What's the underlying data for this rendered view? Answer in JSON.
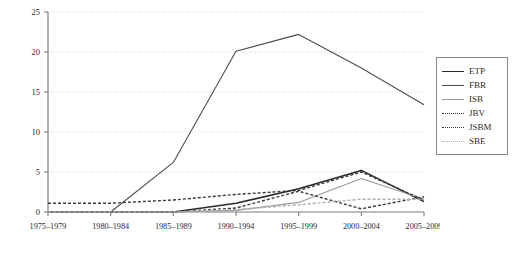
{
  "chart_data": {
    "type": "line",
    "title": "",
    "xlabel": "",
    "ylabel": "",
    "grid": true,
    "legend_position": "right",
    "ylim": [
      0,
      25
    ],
    "yticks": [
      0,
      5,
      10,
      15,
      20,
      25
    ],
    "ytick_labels": [
      "0",
      "5",
      "10",
      "15",
      "20",
      "25"
    ],
    "categories": [
      "1975–1979",
      "1980–1984",
      "1985–1989",
      "1990–1994",
      "1995–1999",
      "2000–2004",
      "2005–2009"
    ],
    "series": [
      {
        "name": "ETP",
        "style": "solid",
        "color": "#2b2b2b",
        "width": 1.6,
        "values": [
          0,
          0,
          0,
          1.1,
          2.9,
          5.2,
          1.3
        ]
      },
      {
        "name": "FBR",
        "style": "solid",
        "color": "#4d4d4d",
        "width": 1.1,
        "values": [
          0,
          0,
          6.2,
          20.1,
          22.2,
          18.0,
          13.4
        ]
      },
      {
        "name": "ISB",
        "style": "solid",
        "color": "#9a9a9a",
        "width": 1.1,
        "values": [
          0,
          0,
          0,
          0.2,
          1.2,
          4.2,
          1.6
        ]
      },
      {
        "name": "JBV",
        "style": "dotted",
        "color": "#3a3a3a",
        "width": 1.4,
        "values": [
          1.1,
          1.1,
          1.5,
          2.2,
          2.7,
          5.0,
          1.5
        ]
      },
      {
        "name": "JSBM",
        "style": "dotted",
        "color": "#3a3a3a",
        "width": 1.4,
        "values": [
          0,
          0,
          0,
          0.5,
          2.6,
          0.4,
          1.9
        ]
      },
      {
        "name": "SBE",
        "style": "dotted",
        "color": "#b0b0b0",
        "width": 1.4,
        "values": [
          0,
          0,
          0,
          0.3,
          0.9,
          1.6,
          1.6
        ]
      }
    ]
  },
  "legend": {
    "items": [
      {
        "label": "ETP"
      },
      {
        "label": "FBR"
      },
      {
        "label": "ISB"
      },
      {
        "label": "JBV"
      },
      {
        "label": "JSBM"
      },
      {
        "label": "SBE"
      }
    ]
  }
}
